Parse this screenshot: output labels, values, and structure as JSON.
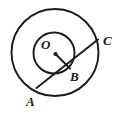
{
  "figure": {
    "stroke_color": "#1a1a1a",
    "fill_color": "#ffffff",
    "background_color": "#ffffff",
    "labels": {
      "center": "O",
      "tangent_point": "B",
      "chord_start": "A",
      "chord_end": "C"
    },
    "geometry": {
      "outer_circle": {
        "cx": 55,
        "cy": 52.5,
        "r": 43.5,
        "stroke_width": 1.9
      },
      "inner_circle": {
        "cx": 54,
        "cy": 53,
        "r": 20.5,
        "stroke_width": 1.9
      },
      "center_dot": {
        "cx": 55.5,
        "cy": 54,
        "r": 2.1
      },
      "radius_segment": {
        "x1": 55.5,
        "y1": 54,
        "x2": 70,
        "y2": 68.5,
        "stroke_width": 1.9
      },
      "chord_segment": {
        "x1": 36.5,
        "y1": 88,
        "x2": 98,
        "y2": 39.5,
        "stroke_width": 1.9
      }
    }
  }
}
